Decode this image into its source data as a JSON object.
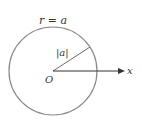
{
  "diagram": {
    "title_equation": "r = a",
    "radius_label": "|a|",
    "origin_label": "O",
    "axis_label": "x",
    "colors": {
      "circle": "#8a8a8a",
      "line": "#444444",
      "text": "#333333"
    }
  }
}
